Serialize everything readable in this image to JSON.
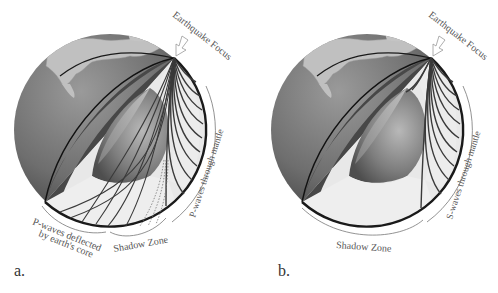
{
  "figure": {
    "panels": [
      {
        "id": "a",
        "letter": "a.",
        "focus_label": "Earthquake Focus",
        "mantle_label": "P-waves through mantle",
        "shadow_label": "Shadow Zone",
        "deflected_label_line1": "P-waves deflected",
        "deflected_label_line2": "by earth's core"
      },
      {
        "id": "b",
        "letter": "b.",
        "focus_label": "Earthquake Focus",
        "mantle_label": "S-waves through mantle",
        "shadow_label": "Shadow Zone"
      }
    ]
  },
  "colors": {
    "background": "#ffffff",
    "globe_dark": "#4a4a4a",
    "globe_mid": "#8a8a8a",
    "land": "#bdbdbd",
    "cutaway_fill": "#eeeeee",
    "wave_line": "#3a3a3a",
    "label_text": "#555555"
  }
}
